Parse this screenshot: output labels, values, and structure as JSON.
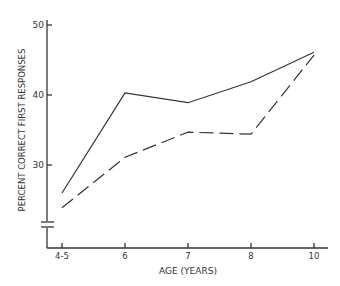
{
  "chart_data": {
    "type": "line",
    "title": "",
    "xlabel": "AGE (YEARS)",
    "ylabel": "PERCENT CORRECT FIRST RESPONSES",
    "categories": [
      "4-5",
      "6",
      "7",
      "8",
      "10"
    ],
    "y_ticks": [
      "30",
      "40",
      "50"
    ],
    "ylim": [
      20,
      50
    ],
    "y_axis_break": true,
    "grid": false,
    "legend": null,
    "series": [
      {
        "name": "solid",
        "style": "solid",
        "values": [
          26,
          40.3,
          38.9,
          41.9,
          46.1
        ]
      },
      {
        "name": "dashed",
        "style": "dashed",
        "values": [
          23.9,
          31.1,
          34.7,
          34.4,
          45.7
        ]
      }
    ]
  },
  "colors": {
    "line": "#333333",
    "axis": "#333333"
  }
}
